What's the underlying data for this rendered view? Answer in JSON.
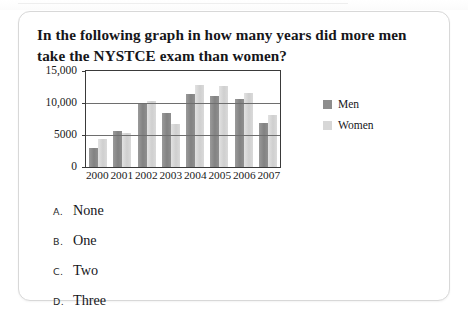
{
  "question": {
    "text": "In the following graph in how many years did more men take the NYSTCE exam than women?"
  },
  "options": [
    {
      "letter": "A.",
      "text": "None"
    },
    {
      "letter": "B.",
      "text": "One"
    },
    {
      "letter": "C.",
      "text": "Two"
    },
    {
      "letter": "D.",
      "text": "Three"
    }
  ],
  "colors": {
    "men": "#8d8d8d",
    "women": "#d7d7d7",
    "axis": "#3a3a3a",
    "gridline": "#6e6e6e",
    "card_border": "#d8d8d8"
  },
  "chart_data": {
    "type": "bar",
    "title": "",
    "xlabel": "",
    "ylabel": "",
    "categories": [
      "2000",
      "2001",
      "2002",
      "2003",
      "2004",
      "2005",
      "2006",
      "2007"
    ],
    "series": [
      {
        "name": "Men",
        "values": [
          2900,
          5600,
          9800,
          8500,
          11400,
          11100,
          10600,
          6800
        ]
      },
      {
        "name": "Women",
        "values": [
          4300,
          5300,
          10300,
          6700,
          12800,
          12700,
          11500,
          8200
        ]
      }
    ],
    "ylim": [
      0,
      15000
    ],
    "ytick_values": [
      0,
      5000,
      10000,
      15000
    ],
    "ytick_labels": [
      "0",
      "5000",
      "10,000",
      "15,000"
    ],
    "grid": true,
    "legend_position": "right"
  }
}
